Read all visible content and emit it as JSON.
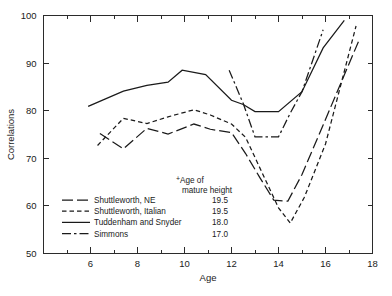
{
  "chart_data": {
    "type": "line",
    "title": "",
    "xlabel": "Age",
    "ylabel": "Correlations",
    "xlim": [
      4,
      18
    ],
    "ylim": [
      50,
      100
    ],
    "xticks": [
      6,
      8,
      10,
      12,
      14,
      16,
      18
    ],
    "xtick_labels": [
      "6",
      "8",
      "10",
      "12",
      "14",
      "16",
      "18"
    ],
    "xminor_step": 1,
    "yticks": [
      50,
      60,
      70,
      80,
      90,
      100
    ],
    "ytick_labels": [
      "50",
      "60",
      "70",
      "80",
      "90",
      "100"
    ],
    "grid": false,
    "legend_position": "lower-left-inside",
    "series": [
      {
        "name": "Shuttleworth, NE",
        "label": "Shuttleworth, NE",
        "mature_height_age": "19.5",
        "dash": "long-dash",
        "x": [
          6.4,
          7.4,
          8.4,
          9.3,
          10.4,
          11.1,
          12.0,
          12.6,
          13.2,
          13.8,
          14.4,
          15.0,
          15.9,
          17.4
        ],
        "y": [
          75.2,
          72.0,
          76.3,
          75.1,
          77.2,
          76.1,
          75.4,
          71.0,
          66.0,
          61.2,
          61.0,
          66.6,
          77.0,
          94.5
        ]
      },
      {
        "name": "Shuttleworth, Italian",
        "label": "Shuttleworth, Italian",
        "mature_height_age": "19.5",
        "dash": "short-dash",
        "x": [
          6.3,
          7.4,
          8.4,
          9.3,
          10.4,
          11.1,
          12.0,
          12.6,
          13.3,
          14.0,
          14.5,
          15.1,
          16.0,
          17.3
        ],
        "y": [
          72.7,
          78.4,
          77.3,
          78.7,
          80.2,
          79.1,
          77.2,
          74.4,
          67.0,
          59.6,
          56.4,
          61.8,
          73.0,
          97.8
        ]
      },
      {
        "name": "Tuddenham and Snyder",
        "label": "Tuddenham and Snyder",
        "mature_height_age": "18.0",
        "dash": "solid",
        "x": [
          5.9,
          7.4,
          8.4,
          9.3,
          9.9,
          10.9,
          12.0,
          12.5,
          13.0,
          14.0,
          15.0,
          15.9,
          16.8
        ],
        "y": [
          80.9,
          84.1,
          85.3,
          86.0,
          88.5,
          87.6,
          82.2,
          81.3,
          79.8,
          79.8,
          84.0,
          93.2,
          99.0
        ]
      },
      {
        "name": "Simmons",
        "label": "Simmons",
        "mature_height_age": "17.0",
        "dash": "dash-dot",
        "x": [
          11.9,
          12.5,
          13.0,
          14.0,
          14.5,
          15.0,
          15.9
        ],
        "y": [
          88.5,
          81.5,
          74.5,
          74.5,
          79.5,
          84.0,
          97.0
        ]
      }
    ],
    "legend": {
      "header_line1": "Age of",
      "header_line2": "mature height",
      "header_marker": "+",
      "entries": [
        {
          "label": "Shuttleworth, NE",
          "value": "19.5",
          "dash": "long-dash"
        },
        {
          "label": "Shuttleworth, Italian",
          "value": "19.5",
          "dash": "short-dash"
        },
        {
          "label": "Tuddenham and Snyder",
          "value": "18.0",
          "dash": "solid"
        },
        {
          "label": "Simmons",
          "value": "17.0",
          "dash": "dash-dot"
        }
      ]
    },
    "colors": {
      "line": "#1a1a1a",
      "axis": "#2b2b2b",
      "background": "#ffffff"
    }
  }
}
